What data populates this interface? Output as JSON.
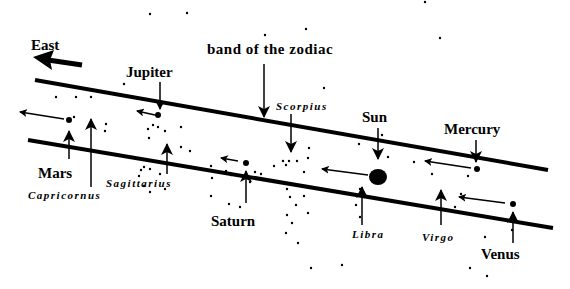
{
  "title": "band of the zodiac",
  "direction_label": "East",
  "colors": {
    "ink": "#000000",
    "background": "#ffffff"
  },
  "planets": [
    {
      "name": "Jupiter",
      "x": 158,
      "y": 115
    },
    {
      "name": "Mars",
      "x": 68,
      "y": 120
    },
    {
      "name": "Saturn",
      "x": 246,
      "y": 163
    },
    {
      "name": "Sun",
      "x": 378,
      "y": 177
    },
    {
      "name": "Mercury",
      "x": 477,
      "y": 169
    },
    {
      "name": "Venus",
      "x": 513,
      "y": 204
    }
  ],
  "constellations": [
    {
      "name": "Capricornus"
    },
    {
      "name": "Sagittarius"
    },
    {
      "name": "Scorpius"
    },
    {
      "name": "Libra"
    },
    {
      "name": "Virgo"
    }
  ]
}
